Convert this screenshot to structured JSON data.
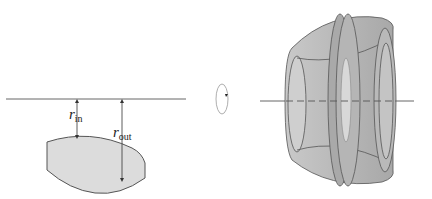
{
  "figure": {
    "left_panel": {
      "description": "cross-section of a lens-shaped region offset from a horizontal axis of rotation",
      "labels": {
        "r_in": {
          "symbol": "r",
          "subscript": "in"
        },
        "r_out": {
          "symbol": "r",
          "subscript": "out"
        }
      }
    },
    "middle": {
      "icon": "rotation-arrow-icon",
      "description": "indicates revolution about the horizontal axis"
    },
    "right_panel": {
      "description": "solid of revolution (washer-shaped solid with hollow core) formed by rotating the region about the axis"
    },
    "colors": {
      "region_fill": "#dcdcdc",
      "solid_fill": "#bdbdbd",
      "solid_dark": "#9a9a9a",
      "outline": "#555555",
      "axis": "#666666"
    }
  }
}
